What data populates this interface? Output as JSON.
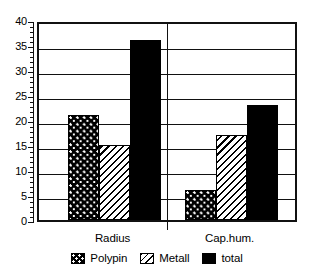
{
  "chart_data": {
    "type": "bar",
    "title": "",
    "subtitle": "",
    "xlabel": "",
    "ylabel": "",
    "categories": [
      "Radius",
      "Cap.hum."
    ],
    "series": [
      {
        "name": "Polypin",
        "values": [
          21,
          6
        ],
        "fill": "dotted",
        "color": "#000000"
      },
      {
        "name": "Metall",
        "values": [
          15,
          17
        ],
        "fill": "diagonal-hatch",
        "color": "#000000"
      },
      {
        "name": "total",
        "values": [
          36,
          23
        ],
        "fill": "solid",
        "color": "#000000"
      }
    ],
    "ylim": [
      0,
      40
    ],
    "y_major_ticks": [
      0,
      5,
      10,
      15,
      20,
      25,
      30,
      35,
      40
    ],
    "y_tick_labels": [
      "0",
      "5",
      "10",
      "15",
      "20",
      "25",
      "30",
      "35",
      "40"
    ],
    "y_minor_tick_step": 1,
    "grid": true,
    "grid_axis": "y",
    "legend_position": "bottom",
    "legend_entries": [
      "Polypin",
      "Metall",
      "total"
    ],
    "group_separator": true,
    "background": "#ffffff",
    "axis_color": "#111111"
  },
  "axis": {
    "y_labels": [
      "40",
      "35",
      "30",
      "25",
      "20",
      "15",
      "10",
      "5",
      "0"
    ]
  },
  "categories": [
    {
      "label": "Radius"
    },
    {
      "label": "Cap.hum."
    }
  ],
  "legend": {
    "items": [
      {
        "label": "Polypin",
        "swatch": "dotted-swatch-icon"
      },
      {
        "label": "Metall",
        "swatch": "hatched-swatch-icon"
      },
      {
        "label": "total",
        "swatch": "solid-swatch-icon"
      }
    ]
  }
}
